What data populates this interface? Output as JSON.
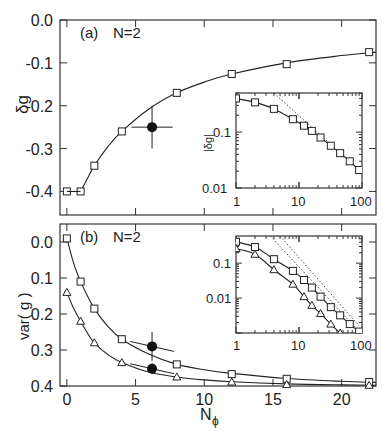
{
  "figure": {
    "panel_a": {
      "label": "(a)",
      "annotation": "N=2",
      "ylabel": "δg",
      "yticks": [
        "0.0",
        "-0.1",
        "-0.2",
        "-0.3",
        "-0.4"
      ],
      "inset": {
        "ylabel": "|δg|",
        "yticks": [
          "0.1",
          "0.01"
        ],
        "xticks": [
          "1",
          "10",
          "100"
        ]
      }
    },
    "panel_b": {
      "label": "(b)",
      "annotation": "N=2",
      "ylabel": "var( g )",
      "yticks": [
        "0.4",
        "0.3",
        "0.2",
        "0.1",
        "0.0"
      ],
      "xticks": [
        "0",
        "5",
        "10",
        "15",
        "20"
      ],
      "xlabel_main": "N",
      "xlabel_sub": "ϕ",
      "inset": {
        "yticks": [
          "0.1",
          "0.01"
        ],
        "xticks": [
          "1",
          "10",
          "100"
        ]
      }
    }
  },
  "chart_data": [
    {
      "type": "scatter",
      "title": "(a) N=2",
      "xlabel": "Nϕ",
      "ylabel": "δg",
      "xlim": [
        -0.5,
        22.5
      ],
      "ylim": [
        -0.455,
        0.0
      ],
      "xticks": [
        0,
        5,
        10,
        15,
        20
      ],
      "yticks": [
        0.0,
        -0.1,
        -0.2,
        -0.3,
        -0.4
      ],
      "series": [
        {
          "name": "squares",
          "marker": "square",
          "x": [
            0,
            1,
            2,
            4,
            8,
            12,
            16,
            22
          ],
          "y": [
            -0.4,
            -0.4,
            -0.34,
            -0.26,
            -0.17,
            -0.126,
            -0.103,
            -0.075
          ]
        },
        {
          "name": "fit",
          "marker": "line",
          "x": [
            1,
            1.5,
            2,
            3,
            4,
            6,
            8,
            10,
            12,
            16,
            20,
            22.5
          ],
          "y": [
            -0.4,
            -0.37,
            -0.34,
            -0.295,
            -0.26,
            -0.207,
            -0.17,
            -0.145,
            -0.126,
            -0.1,
            -0.083,
            -0.075
          ]
        },
        {
          "name": "filled point",
          "marker": "circle",
          "x": [
            6.2
          ],
          "y": [
            -0.25
          ],
          "xerr": [
            1.5
          ],
          "yerr": [
            0.05
          ]
        }
      ],
      "inset": {
        "type": "line",
        "scale": "log-log",
        "ylabel": "|δg|",
        "xlim": [
          1,
          100
        ],
        "ylim": [
          0.01,
          0.5
        ],
        "xticks": [
          1,
          10,
          100
        ],
        "yticks": [
          0.1,
          0.01
        ],
        "series": [
          {
            "name": "squares",
            "marker": "square",
            "x": [
              1,
              2,
              4,
              8,
              12,
              16,
              22,
              32,
              45,
              64,
              90
            ],
            "y": [
              0.4,
              0.34,
              0.26,
              0.17,
              0.13,
              0.105,
              0.08,
              0.057,
              0.042,
              0.03,
              0.021
            ]
          },
          {
            "name": "asymptote",
            "marker": "dotted",
            "x": [
              4,
              90
            ],
            "y": [
              0.5,
              0.021
            ]
          }
        ]
      }
    },
    {
      "type": "scatter",
      "title": "(b) N=2",
      "xlabel": "Nϕ",
      "ylabel": "var( g )",
      "xlim": [
        -0.5,
        22.5
      ],
      "ylim": [
        0.0,
        0.45
      ],
      "xticks": [
        0,
        5,
        10,
        15,
        20
      ],
      "yticks": [
        0.0,
        0.1,
        0.2,
        0.3,
        0.4
      ],
      "series": [
        {
          "name": "squares",
          "marker": "square",
          "x": [
            0,
            1,
            2,
            4,
            8,
            12,
            16,
            22
          ],
          "y": [
            0.41,
            0.29,
            0.215,
            0.13,
            0.06,
            0.033,
            0.02,
            0.011
          ]
        },
        {
          "name": "triangles",
          "marker": "triangle",
          "x": [
            0,
            1,
            2,
            4,
            8,
            12,
            16,
            22
          ],
          "y": [
            0.26,
            0.18,
            0.12,
            0.065,
            0.025,
            0.011,
            0.004,
            0.002
          ]
        },
        {
          "name": "fit squares",
          "marker": "line",
          "x": [
            0,
            0.5,
            1,
            1.5,
            2,
            3,
            4,
            6,
            8,
            10,
            12,
            16,
            20,
            22.5
          ],
          "y": [
            0.41,
            0.34,
            0.29,
            0.25,
            0.215,
            0.165,
            0.13,
            0.088,
            0.06,
            0.045,
            0.035,
            0.021,
            0.013,
            0.01
          ]
        },
        {
          "name": "fit triangles",
          "marker": "line",
          "x": [
            0,
            0.5,
            1,
            1.5,
            2,
            3,
            4,
            6,
            8,
            10,
            12,
            16,
            20,
            22.5
          ],
          "y": [
            0.26,
            0.215,
            0.18,
            0.147,
            0.12,
            0.087,
            0.065,
            0.038,
            0.025,
            0.017,
            0.012,
            0.006,
            0.003,
            0.002
          ]
        },
        {
          "name": "filled points",
          "marker": "circle",
          "x": [
            6.2,
            6.2
          ],
          "y": [
            0.11,
            0.048
          ],
          "xerr": [
            1.6,
            1.6
          ],
          "yerr": [
            0.04,
            0.015
          ]
        }
      ],
      "inset": {
        "type": "line",
        "scale": "log-log",
        "xlim": [
          1,
          100
        ],
        "ylim": [
          0.001,
          0.6
        ],
        "xticks": [
          1,
          10,
          100
        ],
        "yticks": [
          0.1,
          0.01
        ],
        "series": [
          {
            "name": "squares",
            "marker": "square",
            "x": [
              1,
              2,
              4,
              8,
              12,
              16,
              22,
              32,
              45,
              64,
              90
            ],
            "y": [
              0.41,
              0.29,
              0.13,
              0.06,
              0.033,
              0.02,
              0.011,
              0.0055,
              0.0032,
              0.0018,
              0.0011
            ]
          },
          {
            "name": "triangles",
            "marker": "triangle",
            "x": [
              1,
              2,
              4,
              8,
              12,
              16,
              22,
              32,
              45,
              64
            ],
            "y": [
              0.26,
              0.18,
              0.065,
              0.025,
              0.011,
              0.0062,
              0.0036,
              0.0018,
              0.001,
              0.0006
            ]
          },
          {
            "name": "asymptote 1",
            "marker": "dotted",
            "x": [
              3.5,
              90
            ],
            "y": [
              0.6,
              0.0011
            ]
          },
          {
            "name": "asymptote 2",
            "marker": "dotted",
            "x": [
              5,
              90
            ],
            "y": [
              0.6,
              0.0016
            ]
          }
        ]
      }
    }
  ]
}
